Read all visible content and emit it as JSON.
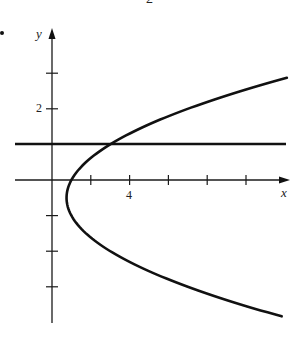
{
  "page": {
    "top_fragment": "2",
    "bullet": "•"
  },
  "chart_data": {
    "type": "line",
    "title": "",
    "xlabel": "x",
    "ylabel": "y",
    "x_tick_labels": [
      {
        "value": 4,
        "label": "4"
      }
    ],
    "y_tick_labels": [
      {
        "value": 2,
        "label": "2"
      }
    ],
    "x_ticks": [
      2,
      4,
      6,
      8,
      10
    ],
    "y_ticks": [
      3,
      2,
      1,
      -1,
      -2,
      -3
    ],
    "xlim": [
      -2,
      12.3
    ],
    "ylim": [
      -4,
      3.4
    ],
    "grid": false,
    "legend": null,
    "series": [
      {
        "name": "parabola x = y^2 + y + 1",
        "kind": "parametric",
        "equation": "x = y^2 + y + 1",
        "y_range": [
          -3.83,
          2.87
        ],
        "vertex": {
          "x": 0.75,
          "y": -0.5
        },
        "points": [
          {
            "x": 11.84,
            "y": -3.83
          },
          {
            "x": 7.0,
            "y": -3.0
          },
          {
            "x": 3.0,
            "y": -2.0
          },
          {
            "x": 1.0,
            "y": -1.0
          },
          {
            "x": 0.75,
            "y": -0.5
          },
          {
            "x": 1.0,
            "y": 0.0
          },
          {
            "x": 3.0,
            "y": 1.0
          },
          {
            "x": 7.0,
            "y": 2.0
          },
          {
            "x": 12.1,
            "y": 2.87
          }
        ]
      },
      {
        "name": "horizontal line y = 1",
        "kind": "line",
        "equation": "y = 1",
        "x_range": [
          -1.9,
          12.3
        ]
      }
    ],
    "intersection": {
      "x": 3,
      "y": 1
    }
  }
}
